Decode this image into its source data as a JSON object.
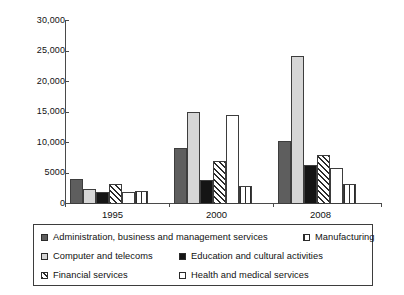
{
  "chart_data": {
    "type": "bar",
    "title": "",
    "subtitle": "",
    "xlabel": "",
    "ylabel": "",
    "categories": [
      "1995",
      "2000",
      "2008"
    ],
    "ylim": [
      0,
      30000
    ],
    "y_ticks": [
      0,
      5000,
      10000,
      15000,
      20000,
      25000,
      30000
    ],
    "y_tick_labels": [
      "0",
      "5000",
      "10,000",
      "15,000",
      "20,000",
      "25,000",
      "30,000"
    ],
    "grid": false,
    "legend_position": "bottom",
    "series": [
      {
        "name": "Administration, business and management services",
        "pattern": "solid-dark-gray",
        "color": "#5e5e5e",
        "values": [
          4100,
          9200,
          10400
        ]
      },
      {
        "name": "Computer and telecoms",
        "pattern": "solid-light-gray",
        "color": "#d6d6d6",
        "values": [
          2400,
          15100,
          24300
        ]
      },
      {
        "name": "Education and cultural activities",
        "pattern": "solid-black",
        "color": "#151515",
        "values": [
          1950,
          3950,
          6400
        ]
      },
      {
        "name": "Financial services",
        "pattern": "diagonal-hatch",
        "color": "#ffffff",
        "values": [
          3250,
          7100,
          8000
        ]
      },
      {
        "name": "Health and medical services",
        "pattern": "empty-white",
        "color": "#ffffff",
        "values": [
          1900,
          14600,
          5950
        ]
      },
      {
        "name": "Manufacturing",
        "pattern": "vertical-lines",
        "color": "#ffffff",
        "values": [
          2100,
          2900,
          3300
        ]
      }
    ]
  },
  "legend": {
    "rows": [
      {
        "left": {
          "label": "Administration, business and management services",
          "pattern": "solid-dark-gray"
        },
        "right": {
          "label": "Manufacturing",
          "pattern": "vertical-lines"
        }
      },
      {
        "left": {
          "label": "Computer and telecoms",
          "pattern": "solid-light-gray"
        },
        "right": {
          "label": "Education and cultural activities",
          "pattern": "solid-black"
        }
      },
      {
        "left": {
          "label": "Financial services",
          "pattern": "diagonal-hatch"
        },
        "right": {
          "label": "Health and medical services",
          "pattern": "empty-white"
        }
      }
    ]
  }
}
